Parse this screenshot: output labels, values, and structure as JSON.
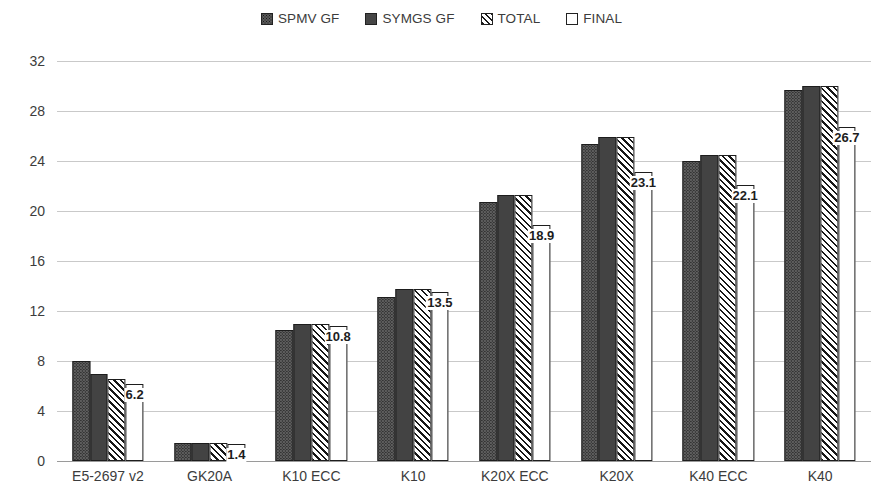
{
  "chart_data": {
    "type": "bar",
    "title": "",
    "xlabel": "",
    "ylabel": "",
    "ylim": [
      0,
      32
    ],
    "yticks": [
      0,
      4,
      8,
      12,
      16,
      20,
      24,
      28,
      32
    ],
    "grid": true,
    "legend_position": "top-center",
    "categories": [
      "E5-2697 v2",
      "GK20A",
      "K10 ECC",
      "K10",
      "K20X ECC",
      "K20X",
      "K40 ECC",
      "K40"
    ],
    "series": [
      {
        "name": "SPMV GF",
        "swatch": "dotted-dark-gray",
        "values": [
          8.0,
          1.45,
          10.5,
          13.1,
          20.7,
          25.4,
          24.0,
          29.7
        ]
      },
      {
        "name": "SYMGS GF",
        "swatch": "solid-dark-gray",
        "values": [
          7.0,
          1.45,
          11.0,
          13.8,
          21.3,
          25.9,
          24.5,
          30.0
        ]
      },
      {
        "name": "TOTAL",
        "swatch": "diagonal-hatch",
        "values": [
          6.6,
          1.45,
          11.0,
          13.8,
          21.3,
          25.9,
          24.5,
          30.0
        ]
      },
      {
        "name": "FINAL",
        "swatch": "white",
        "values": [
          6.2,
          1.4,
          10.8,
          13.5,
          18.9,
          23.1,
          22.1,
          26.7
        ]
      }
    ],
    "data_labels": {
      "series": "FINAL",
      "values": [
        "6.2",
        "1.4",
        "10.8",
        "13.5",
        "18.9",
        "23.1",
        "22.1",
        "26.7"
      ]
    }
  },
  "legend": {
    "items": [
      {
        "label": "SPMV GF",
        "swatch_class": "sw-spmv"
      },
      {
        "label": "SYMGS GF",
        "swatch_class": "sw-symgs"
      },
      {
        "label": "TOTAL",
        "swatch_class": "sw-total"
      },
      {
        "label": "FINAL",
        "swatch_class": "sw-final"
      }
    ]
  },
  "colors": {
    "spmv": "#5d5d5d",
    "symgs": "#434343",
    "total_hatch": "#171717",
    "final": "#ffffff",
    "gridline": "#c9c9c9",
    "baseline": "#9a9a9a",
    "text": "#3c3c3c"
  }
}
